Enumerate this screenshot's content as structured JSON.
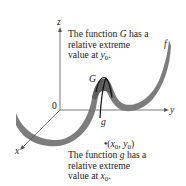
{
  "figure": {
    "axes": {
      "x_label": "x",
      "y_label": "y",
      "z_label": "z",
      "origin_label": "0"
    },
    "curves": {
      "surface_label": "f",
      "G_label": "G",
      "g_label": "g"
    },
    "top_annotation": {
      "line1_prefix": "The function ",
      "line1_var": "G",
      "line1_suffix": " has a",
      "line2": "relative extreme",
      "line3_prefix": "value at ",
      "line3_var": "y",
      "line3_sub": "0",
      "line3_suffix": "."
    },
    "point": {
      "bullet": "•",
      "open": "(",
      "x_var": "x",
      "x_sub": "0",
      "comma": ", ",
      "y_var": "y",
      "y_sub": "0",
      "close": ")"
    },
    "bottom_annotation": {
      "line1_prefix": "The function ",
      "line1_var": "g",
      "line1_suffix": " has a",
      "line2": "relative extreme",
      "line3_prefix": "value at ",
      "line3_var": "x",
      "line3_sub": "0",
      "line3_suffix": "."
    },
    "colors": {
      "surface": "#7d7d7d",
      "surface_dark": "#5e5e5e",
      "axis": "#555555",
      "curve": "#111111"
    }
  }
}
